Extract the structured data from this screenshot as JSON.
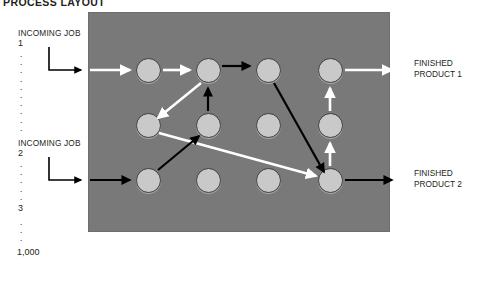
{
  "title": "PROCESS LAYOUT",
  "colors": {
    "floor_background": "#797979",
    "machine_fill": "#c9c9c9",
    "machine_stroke": "#3b3b3b",
    "flow_path_1": "#ffffff",
    "flow_path_2": "#000000",
    "page_background": "#ffffff",
    "text": "#231f20"
  },
  "left_labels": {
    "job1_title": "INCOMING JOB",
    "job1_number": "1",
    "dots_after_job1": [
      ".",
      ".",
      ".",
      ".",
      ".",
      ".",
      ".",
      ".",
      ".",
      "."
    ],
    "job2_title": "INCOMING JOB",
    "job2_number": "2",
    "dots_after_job2": [
      ".",
      ".",
      ".",
      ".",
      "."
    ],
    "job3_number": "3",
    "dots_after_job3": [
      ".",
      ".",
      "."
    ],
    "job_last_number": "1,000"
  },
  "right_labels": {
    "product1_line1": "FINISHED",
    "product1_line2": "PRODUCT 1",
    "product2_line1": "FINISHED",
    "product2_line2": "PRODUCT 2"
  },
  "floor": {
    "machines": [
      {
        "id": "m-r1c1",
        "row": 1,
        "col": 1,
        "cx": 148,
        "cy": 70
      },
      {
        "id": "m-r1c2",
        "row": 1,
        "col": 2,
        "cx": 208,
        "cy": 70
      },
      {
        "id": "m-r1c3",
        "row": 1,
        "col": 3,
        "cx": 268,
        "cy": 70
      },
      {
        "id": "m-r1c4",
        "row": 1,
        "col": 4,
        "cx": 330,
        "cy": 70
      },
      {
        "id": "m-r2c1",
        "row": 2,
        "col": 1,
        "cx": 148,
        "cy": 125
      },
      {
        "id": "m-r2c2",
        "row": 2,
        "col": 2,
        "cx": 208,
        "cy": 125
      },
      {
        "id": "m-r2c3",
        "row": 2,
        "col": 3,
        "cx": 268,
        "cy": 125
      },
      {
        "id": "m-r2c4",
        "row": 2,
        "col": 4,
        "cx": 330,
        "cy": 125
      },
      {
        "id": "m-r3c1",
        "row": 3,
        "col": 1,
        "cx": 148,
        "cy": 180
      },
      {
        "id": "m-r3c2",
        "row": 3,
        "col": 2,
        "cx": 208,
        "cy": 180
      },
      {
        "id": "m-r3c3",
        "row": 3,
        "col": 3,
        "cx": 268,
        "cy": 180
      },
      {
        "id": "m-r3c4",
        "row": 3,
        "col": 4,
        "cx": 330,
        "cy": 180
      }
    ],
    "path_job1": {
      "color": "#ffffff",
      "segments": [
        "entry into machine r1c1",
        "r1c1 to r1c2",
        "r1c2 down-left to r2c1",
        "r2c1 down-right to r3c4",
        "r3c4 up to r2c4",
        "r2c4 up to r1c4",
        "r1c4 exit to FINISHED PRODUCT 1"
      ]
    },
    "path_job2": {
      "color": "#000000",
      "segments": [
        "entry into machine r3c1",
        "r3c1 up-right to r2c2",
        "r2c2 up to r1c2",
        "r1c2 to r1c3",
        "r1c3 down-right to r3c4",
        "r3c4 exit to FINISHED PRODUCT 2"
      ]
    }
  }
}
